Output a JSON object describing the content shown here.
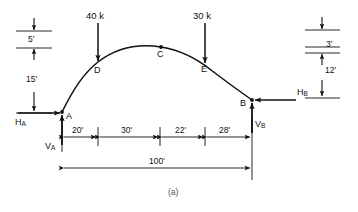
{
  "figure": {
    "caption": "(a)",
    "type": "three-hinged-arch-free-body-diagram"
  },
  "loads": [
    {
      "name": "load-40k",
      "label": "40 k",
      "at_node": "D",
      "direction": "down",
      "magnitude": 40,
      "unit": "k"
    },
    {
      "name": "load-30k",
      "label": "30 k",
      "at_node": "E",
      "direction": "down",
      "magnitude": 30,
      "unit": "k"
    }
  ],
  "nodes": [
    {
      "name": "node-A",
      "label": "A"
    },
    {
      "name": "node-D",
      "label": "D"
    },
    {
      "name": "node-C",
      "label": "C"
    },
    {
      "name": "node-E",
      "label": "E"
    },
    {
      "name": "node-B",
      "label": "B"
    }
  ],
  "reactions": [
    {
      "name": "reaction-HA",
      "symbol": "H",
      "subscript": "A",
      "direction": "right"
    },
    {
      "name": "reaction-VA",
      "symbol": "V",
      "subscript": "A",
      "direction": "up"
    },
    {
      "name": "reaction-HB",
      "symbol": "H",
      "subscript": "B",
      "direction": "left"
    },
    {
      "name": "reaction-VB",
      "symbol": "V",
      "subscript": "B",
      "direction": "up"
    }
  ],
  "dimensions": {
    "left_stack": [
      {
        "name": "dim-5ft",
        "label": "5'",
        "value": 5,
        "unit": "ft"
      },
      {
        "name": "dim-15ft",
        "label": "15'",
        "value": 15,
        "unit": "ft"
      }
    ],
    "right_stack": [
      {
        "name": "dim-3ft",
        "label": "3'",
        "value": 3,
        "unit": "ft"
      },
      {
        "name": "dim-12ft",
        "label": "12'",
        "value": 12,
        "unit": "ft"
      }
    ],
    "span_chain": [
      {
        "name": "dim-20ft",
        "label": "20'",
        "value": 20,
        "unit": "ft"
      },
      {
        "name": "dim-30ft",
        "label": "30'",
        "value": 30,
        "unit": "ft"
      },
      {
        "name": "dim-22ft",
        "label": "22'",
        "value": 22,
        "unit": "ft"
      },
      {
        "name": "dim-28ft",
        "label": "28'",
        "value": 28,
        "unit": "ft"
      }
    ],
    "total_span": {
      "name": "dim-100ft",
      "label": "100'",
      "value": 100,
      "unit": "ft"
    }
  },
  "colors": {
    "ink": "#111111",
    "background": "#ffffff",
    "caption": "#555555"
  }
}
